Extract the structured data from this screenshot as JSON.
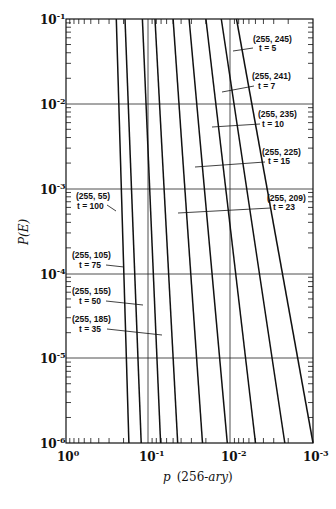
{
  "chart_data": {
    "type": "line",
    "title": "",
    "xlabel": "p  (256-ary)",
    "ylabel": "P(E)",
    "x_scale": "log",
    "y_scale": "log",
    "x_reversed": true,
    "xlim": [
      1,
      0.001
    ],
    "ylim": [
      1e-06,
      0.1
    ],
    "x_ticks": [
      "10^0",
      "10^-1",
      "10^-2",
      "10^-3"
    ],
    "y_ticks": [
      "10^-1",
      "10^-2",
      "10^-3",
      "10^-4",
      "10^-5",
      "10^-6"
    ],
    "grid": "horizontal lines at each decade; vertical reference lines near 10^-1 and 10^-2",
    "legend": "none (inline annotations)",
    "series": [
      {
        "name": "(255, 55) t = 100",
        "code": "(255, 55)",
        "t": "t = 100",
        "points": [
          [
            0.245,
            0.1
          ],
          [
            0.172,
            1e-06
          ]
        ]
      },
      {
        "name": "(255, 105) t = 75",
        "code": "(255, 105)",
        "t": "t = 75",
        "points": [
          [
            0.192,
            0.1
          ],
          [
            0.122,
            1e-06
          ]
        ]
      },
      {
        "name": "(255, 155) t = 50",
        "code": "(255, 155)",
        "t": "t = 50",
        "points": [
          [
            0.118,
            0.1
          ],
          [
            0.071,
            1e-06
          ]
        ]
      },
      {
        "name": "(255, 185) t = 35",
        "code": "(255, 185)",
        "t": "t = 35",
        "points": [
          [
            0.083,
            0.1
          ],
          [
            0.044,
            1e-06
          ]
        ]
      },
      {
        "name": "(255, 209) t = 23",
        "code": "(255, 209)",
        "t": "t = 23",
        "points": [
          [
            0.05,
            0.1
          ],
          [
            0.022,
            1e-06
          ]
        ]
      },
      {
        "name": "(255, 225) t = 15",
        "code": "(255, 225)",
        "t": "t = 15",
        "points": [
          [
            0.032,
            0.1
          ],
          [
            0.011,
            1e-06
          ]
        ]
      },
      {
        "name": "(255, 235) t = 10",
        "code": "(255, 235)",
        "t": "t = 10",
        "points": [
          [
            0.02,
            0.1
          ],
          [
            0.005,
            1e-06
          ]
        ]
      },
      {
        "name": "(255, 241) t = 7",
        "code": "(255, 241)",
        "t": "t = 7",
        "points": [
          [
            0.013,
            0.1
          ],
          [
            0.0022,
            1e-06
          ]
        ]
      },
      {
        "name": "(255, 245) t = 5",
        "code": "(255, 245)",
        "t": "t = 5",
        "points": [
          [
            0.0085,
            0.1
          ],
          [
            0.001,
            1e-06
          ]
        ]
      }
    ]
  },
  "axes": {
    "x_title_italic": "p",
    "x_title_paren": "(256-",
    "x_title_ary": "ary",
    "x_title_close": ")",
    "y_title": "P(E)",
    "x_ticks": [
      {
        "base": "10",
        "exp": "0"
      },
      {
        "base": "10",
        "exp": "-1"
      },
      {
        "base": "10",
        "exp": "-2"
      },
      {
        "base": "10",
        "exp": "-3"
      }
    ],
    "y_ticks": [
      {
        "base": "10",
        "exp": "-1"
      },
      {
        "base": "10",
        "exp": "-2"
      },
      {
        "base": "10",
        "exp": "-3"
      },
      {
        "base": "10",
        "exp": "-4"
      },
      {
        "base": "10",
        "exp": "-5"
      },
      {
        "base": "10",
        "exp": "-6"
      }
    ]
  },
  "annotations": [
    {
      "code": "(255, 245)",
      "t": "t = 5"
    },
    {
      "code": "(255, 241)",
      "t": "t = 7"
    },
    {
      "code": "(255, 235)",
      "t": "t = 10"
    },
    {
      "code": "(255, 225)",
      "t": "t = 15"
    },
    {
      "code": "(255, 209)",
      "t": "t = 23"
    },
    {
      "code": "(255, 55)",
      "t": "t = 100"
    },
    {
      "code": "(255, 105)",
      "t": "t = 75"
    },
    {
      "code": "(255, 155)",
      "t": "t = 50"
    },
    {
      "code": "(255, 185)",
      "t": "t = 35"
    }
  ]
}
